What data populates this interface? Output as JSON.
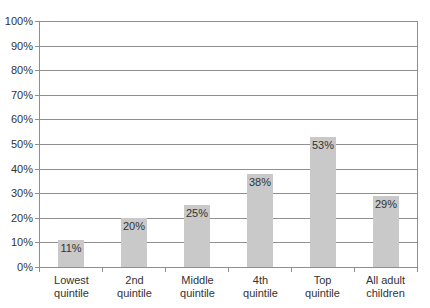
{
  "chart_data": {
    "type": "bar",
    "title": "",
    "xlabel": "",
    "ylabel": "",
    "categories": [
      "Lowest\nquintile",
      "2nd\nquintile",
      "Middle\nquintile",
      "4th\nquintile",
      "Top\nquintile",
      "All adult\nchildren"
    ],
    "values": [
      11,
      20,
      25,
      38,
      53,
      29
    ],
    "bar_labels": [
      "11%",
      "20%",
      "25%",
      "38%",
      "53%",
      "29%"
    ],
    "ylim": [
      0,
      100
    ],
    "ytick_interval": 10,
    "ytick_labels": [
      "0%",
      "10%",
      "20%",
      "30%",
      "40%",
      "50%",
      "60%",
      "70%",
      "80%",
      "90%",
      "100%"
    ],
    "grid": true,
    "legend": false,
    "colors": {
      "bar": "#c9c9c9",
      "grid": "#8f8f8f",
      "axis": "#8f8f8f",
      "text": "#333333",
      "background": "#ffffff"
    }
  }
}
